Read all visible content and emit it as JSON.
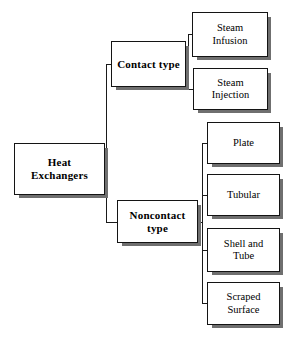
{
  "diagram": {
    "background_color": "#ffffff",
    "line_color": "#1a1a1a",
    "box_border_color": "#141414",
    "box_fill_color": "#ffffff",
    "shadow_color": "#6f6f6f",
    "root": {
      "id": "heat-exchangers",
      "label": "Heat\nExchangers"
    },
    "branches": [
      {
        "id": "contact-type",
        "label": "Contact  type",
        "children": [
          {
            "id": "steam-infusion",
            "label": "Steam\nInfusion"
          },
          {
            "id": "steam-injection",
            "label": "Steam\nInjection"
          }
        ]
      },
      {
        "id": "noncontact-type",
        "label": "Noncontact\ntype",
        "children": [
          {
            "id": "plate",
            "label": "Plate"
          },
          {
            "id": "tubular",
            "label": "Tubular"
          },
          {
            "id": "shell-and-tube",
            "label": "Shell and\nTube"
          },
          {
            "id": "scraped-surface",
            "label": "Scraped\nSurface"
          }
        ]
      }
    ]
  }
}
